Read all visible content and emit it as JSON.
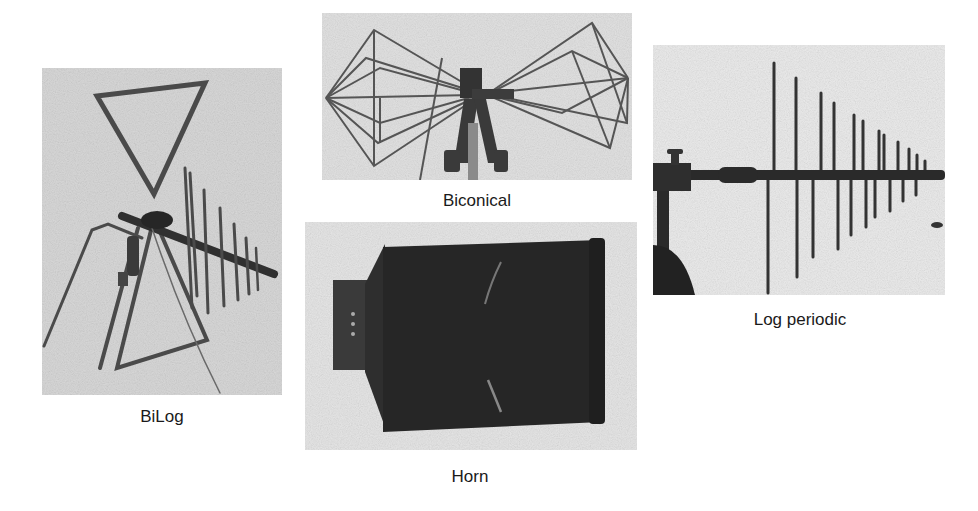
{
  "figure": {
    "panels": [
      {
        "id": "bilog",
        "label": "BiLog",
        "icon": "bilog-antenna-photo"
      },
      {
        "id": "biconical",
        "label": "Biconical",
        "icon": "biconical-antenna-photo"
      },
      {
        "id": "horn",
        "label": "Horn",
        "icon": "horn-antenna-photo"
      },
      {
        "id": "logperiodic",
        "label": "Log periodic",
        "icon": "log-periodic-antenna-photo"
      }
    ],
    "colors": {
      "background": "#ffffff",
      "photo_bg": "#d9d9d9",
      "metal": "#4a4a4a",
      "dark": "#262626",
      "caption": "#1a1a1a"
    }
  }
}
